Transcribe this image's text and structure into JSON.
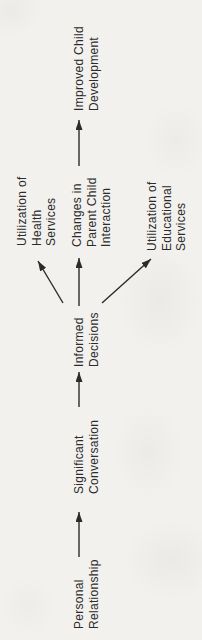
{
  "diagram": {
    "colors": {
      "paper": "#f2f1ee",
      "ink": "#2b2b2b"
    },
    "nodes": {
      "personal": {
        "label": "Personal\nRelationship"
      },
      "significant": {
        "label": "Significant\nConversation"
      },
      "informed": {
        "label": "Informed\nDecisions"
      },
      "health": {
        "label": "Utilization of\nHealth Services"
      },
      "parent_child": {
        "label": "Changes in\nParent Child\nInteraction"
      },
      "educational": {
        "label": "Utilization of\nEducational\nServices"
      },
      "improved": {
        "label": "Improved Child\nDevelopment"
      }
    },
    "edges": [
      {
        "from": "Personal Relationship",
        "to": "Significant Conversation"
      },
      {
        "from": "Significant Conversation",
        "to": "Informed Decisions"
      },
      {
        "from": "Informed Decisions",
        "to": "Utilization of Health Services"
      },
      {
        "from": "Informed Decisions",
        "to": "Changes in Parent Child Interaction"
      },
      {
        "from": "Informed Decisions",
        "to": "Utilization of Educational Services"
      },
      {
        "from": "Changes in Parent Child Interaction",
        "to": "Improved Child Development"
      }
    ],
    "orientation": "rotated-90-ccw"
  }
}
